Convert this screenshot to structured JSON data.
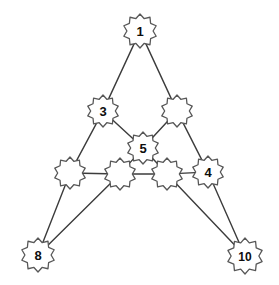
{
  "figure": {
    "background_color": "#ffffff",
    "node_fill": "#ffffff",
    "node_stroke": "#585858",
    "edge_color": "#3c3c3c",
    "label_color": "#0d0d0d"
  },
  "chart_data": {
    "type": "diagram",
    "title": "",
    "xlabel": "",
    "ylabel": "",
    "layout": "triangular node-link graph with starburst (10-point star) nodes",
    "nodes": [
      {
        "id": "n1",
        "label": "1",
        "x": 140,
        "y": 31,
        "r": 17,
        "labeled": true
      },
      {
        "id": "n3",
        "label": "3",
        "x": 103,
        "y": 111,
        "r": 16,
        "labeled": true
      },
      {
        "id": "nA",
        "label": "",
        "x": 177,
        "y": 111,
        "r": 16,
        "labeled": false
      },
      {
        "id": "n5",
        "label": "5",
        "x": 143,
        "y": 148,
        "r": 16,
        "labeled": true
      },
      {
        "id": "nB",
        "label": "",
        "x": 70,
        "y": 173,
        "r": 16,
        "labeled": false
      },
      {
        "id": "nC",
        "label": "",
        "x": 120,
        "y": 174,
        "r": 16,
        "labeled": false
      },
      {
        "id": "nD",
        "label": "",
        "x": 167,
        "y": 174,
        "r": 16,
        "labeled": false
      },
      {
        "id": "n4",
        "label": "4",
        "x": 208,
        "y": 172,
        "r": 16,
        "labeled": true
      },
      {
        "id": "n8",
        "label": "8",
        "x": 38,
        "y": 255,
        "r": 17,
        "labeled": true
      },
      {
        "id": "n10",
        "label": "10",
        "x": 245,
        "y": 256,
        "r": 18,
        "labeled": true
      }
    ],
    "edges": [
      {
        "from": "n1",
        "to": "n3"
      },
      {
        "from": "n1",
        "to": "nA"
      },
      {
        "from": "n3",
        "to": "n5"
      },
      {
        "from": "nA",
        "to": "n5"
      },
      {
        "from": "n3",
        "to": "nB"
      },
      {
        "from": "nA",
        "to": "n4"
      },
      {
        "from": "n5",
        "to": "nC"
      },
      {
        "from": "n5",
        "to": "nD"
      },
      {
        "from": "nB",
        "to": "nC"
      },
      {
        "from": "nC",
        "to": "nD"
      },
      {
        "from": "nD",
        "to": "n4"
      },
      {
        "from": "nB",
        "to": "n8"
      },
      {
        "from": "nC",
        "to": "n8"
      },
      {
        "from": "nD",
        "to": "n10"
      },
      {
        "from": "n4",
        "to": "n10"
      }
    ],
    "node_count": 10,
    "edge_count": 15,
    "labels_shown": [
      "1",
      "3",
      "5",
      "4",
      "8",
      "10"
    ]
  }
}
